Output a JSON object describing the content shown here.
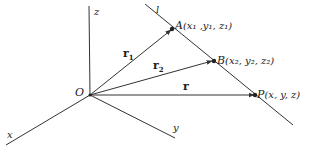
{
  "diagram": {
    "type": "3d-vector-line",
    "origin_label": "O",
    "axes": {
      "x": "x",
      "y": "y",
      "z": "z"
    },
    "line_label": "l",
    "points": {
      "A": {
        "name": "A",
        "coords_label": "(x₁ ,y₁, z₁)"
      },
      "B": {
        "name": "B",
        "coords_label": "(x₂, y₂, z₂)"
      },
      "P": {
        "name": "P",
        "coords_label": "(x, y, z)"
      }
    },
    "vectors": {
      "r1": {
        "base": "r",
        "sub": "1"
      },
      "r2": {
        "base": "r",
        "sub": "2"
      },
      "r": {
        "base": "r",
        "sub": ""
      }
    },
    "colors": {
      "stroke": "#333333",
      "text": "#222222",
      "background": "#ffffff"
    }
  }
}
